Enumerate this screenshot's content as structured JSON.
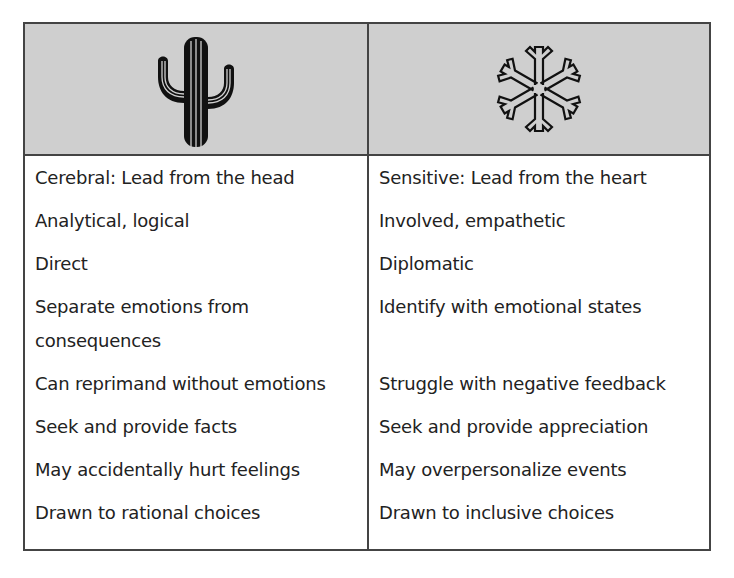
{
  "table": {
    "header": {
      "left_icon": "cactus-icon",
      "right_icon": "snowflake-icon",
      "background_color": "#cfcfcf"
    },
    "left_column": [
      {
        "text": "Cerebral: Lead from the head"
      },
      {
        "text": "Analytical, logical"
      },
      {
        "text": "Direct"
      },
      {
        "text": "Separate emotions from consequences"
      },
      {
        "text": "Can reprimand without emotions"
      },
      {
        "text": "Seek and provide facts"
      },
      {
        "text": "May accidentally hurt feelings"
      },
      {
        "text": "Drawn to rational choices"
      }
    ],
    "right_column": [
      {
        "text": "Sensitive: Lead from the heart"
      },
      {
        "text": "Involved, empathetic"
      },
      {
        "text": "Diplomatic"
      },
      {
        "text": "Identify with emotional states"
      },
      {
        "text": "Struggle with negative feedback"
      },
      {
        "text": "Seek and provide appreciation"
      },
      {
        "text": "May overpersonalize events"
      },
      {
        "text": "Drawn to inclusive choices"
      }
    ]
  }
}
